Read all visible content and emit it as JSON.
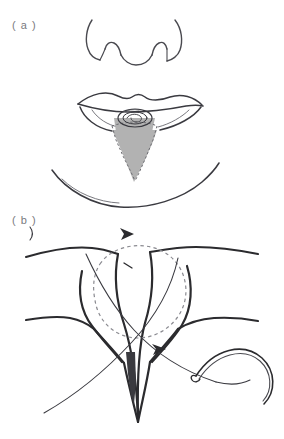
{
  "figure": {
    "top_caption": "",
    "background_color": "#ffffff",
    "ink_color": "#2b2b2e",
    "light_ink_color": "#55555a",
    "shade_color": "#b2b2b2",
    "shade_edge_color": "#8c8c8c",
    "label_color": "#7a7a80",
    "width": 284,
    "height": 439
  },
  "panels": [
    {
      "id": "a",
      "label": "( a )",
      "label_x": 12,
      "label_y": 19,
      "title": "lower lip lesion with planned V-wedge excision",
      "elements": [
        {
          "name": "nose-outline",
          "type": "line-art"
        },
        {
          "name": "upper-lip-outline",
          "type": "line-art"
        },
        {
          "name": "lower-lip-outline",
          "type": "line-art"
        },
        {
          "name": "lip-lesion",
          "type": "line-art"
        },
        {
          "name": "wedge-excision-shaded-area",
          "type": "filled-shape",
          "fill": "#b2b2b2"
        },
        {
          "name": "wedge-excision-dashed-outline",
          "type": "dashed-line"
        },
        {
          "name": "chin-crease-outline",
          "type": "line-art"
        }
      ]
    },
    {
      "id": "b",
      "label": "( b )",
      "label_x": 12,
      "label_y": 214,
      "title": "wedge defect closure with suture and curved needle",
      "elements": [
        {
          "name": "vermilion-border-line",
          "type": "line-art"
        },
        {
          "name": "wedge-defect-outline",
          "type": "line-art"
        },
        {
          "name": "dashed-circle-marker",
          "type": "dashed-line"
        },
        {
          "name": "suture-thread",
          "type": "line-art"
        },
        {
          "name": "curved-needle",
          "type": "line-art"
        },
        {
          "name": "direction-arrowhead-top",
          "type": "arrowhead"
        },
        {
          "name": "direction-arrowhead-middle",
          "type": "arrowhead"
        },
        {
          "name": "needle-entry-tick",
          "type": "tick-mark"
        },
        {
          "name": "dark-wedge-spike",
          "type": "filled-shape",
          "fill": "#3a3a3f"
        }
      ]
    }
  ]
}
